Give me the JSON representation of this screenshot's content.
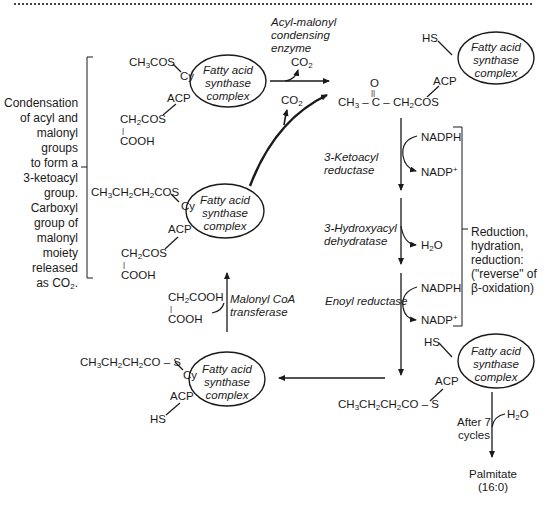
{
  "diagram": {
    "complex_label": "Fatty acid synthase complex",
    "complex_lines": [
      "Fatty acid",
      "synthase",
      "complex"
    ],
    "left_annotation": [
      "Condensation",
      "of acyl and",
      "malonyl",
      "groups",
      "to form a",
      "3-ketoacyl",
      "group.",
      "Carboxyl",
      "group of",
      "malonyl",
      "moiety",
      "released",
      "as CO2."
    ],
    "right_annotation": [
      "Reduction,",
      "hydration,",
      "reduction:",
      "(\"reverse\" of",
      "β-oxidation)"
    ],
    "enzymes": {
      "condensing": [
        "Acyl-malonyl",
        "condensing",
        "enzyme"
      ],
      "ketoacyl_reductase": [
        "3-Ketoacyl",
        "reductase"
      ],
      "dehydratase": [
        "3-Hydroxyacyl",
        "dehydratase"
      ],
      "enoyl_reductase": "Enoyl reductase",
      "malonyl_transferase": [
        "Malonyl CoA",
        "transferase"
      ]
    },
    "cofactors": {
      "nadph_1": "NADPH",
      "nadp_1": "NADP+",
      "h2o_1": "H2O",
      "nadph_2": "NADPH",
      "nadp_2": "NADP+",
      "co2_1": "CO2",
      "co2_2": "CO2",
      "h2o_2": "H2O"
    },
    "complex_top_left": {
      "cy_substituent": "CH3COS",
      "cy": "Cy",
      "acp": "ACP",
      "acp_substituent": [
        "CH2COS",
        "|",
        "COOH"
      ]
    },
    "complex_top_right": {
      "hs": "HS",
      "acp": "ACP",
      "ketoacyl": "CH3 – C – CH2COS",
      "keto_o": "O",
      "keto_bond": "||"
    },
    "complex_mid_left": {
      "cy_substituent": "CH3CH2CH2COS",
      "cy": "Cy",
      "acp": "ACP",
      "acp_substituent": [
        "CH2COS",
        "|",
        "COOH"
      ]
    },
    "malonyl": [
      "CH2COOH",
      "|",
      "COOH"
    ],
    "complex_bottom_left": {
      "cy_substituent": "CH3CH2CH2CO – S",
      "cy": "Cy",
      "acp": "ACP",
      "hs": "HS"
    },
    "complex_bottom_right": {
      "hs": "HS",
      "acp": "ACP",
      "acp_substituent": "CH3CH2CH2CO – S"
    },
    "termination": {
      "condition": [
        "After 7",
        "cycles"
      ],
      "product": [
        "Palmitate",
        "(16:0)"
      ]
    }
  }
}
